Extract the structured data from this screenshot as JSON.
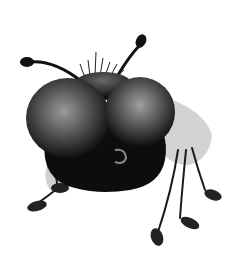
{
  "image": {
    "description": "Grayscale illustration of a cartoon fly with large bulbous compound eyes, two antennae, bristles on head, translucent wings and thin dangling legs",
    "subject": "cartoon fly",
    "background": "#ffffff",
    "colors": {
      "body": "#0d0d0d",
      "eye_highlight": "#8a8a8a",
      "wing": "#c9c9c9",
      "leg": "#1a1a1a"
    }
  }
}
